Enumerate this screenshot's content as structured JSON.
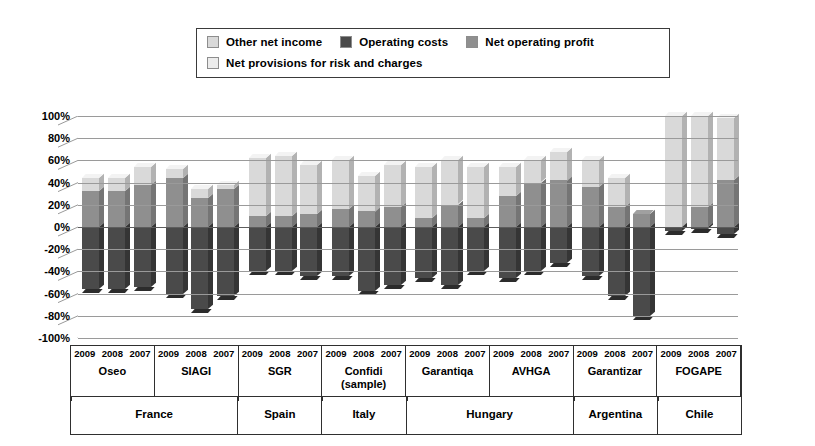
{
  "legend": {
    "rows": [
      [
        {
          "label": "Other net income",
          "color": "#d9d9d9",
          "key": "other_net_income"
        },
        {
          "label": "Operating costs",
          "color": "#4a4a4a",
          "key": "operating_costs"
        },
        {
          "label": "Net operating profit",
          "color": "#8f8f8f",
          "key": "net_operating_profit"
        }
      ],
      [
        {
          "label": "Net provisions for risk and charges",
          "color": "#ececec",
          "key": "net_provisions"
        }
      ]
    ]
  },
  "chart_data": {
    "type": "bar",
    "stacked": true,
    "title": "",
    "xlabel": "",
    "ylabel": "",
    "ylim": [
      -100,
      100
    ],
    "ytick_labels": [
      "100%",
      "80%",
      "60%",
      "40%",
      "20%",
      "0%",
      "-20%",
      "-40%",
      "-60%",
      "-80%",
      "-100%"
    ],
    "ytick_values": [
      100,
      80,
      60,
      40,
      20,
      0,
      -20,
      -40,
      -60,
      -80,
      -100
    ],
    "grid": true,
    "legend_position": "top",
    "series": [
      {
        "name": "Other net income",
        "color": "#d9d9d9"
      },
      {
        "name": "Operating costs",
        "color": "#4a4a4a"
      },
      {
        "name": "Net operating profit",
        "color": "#8f8f8f"
      },
      {
        "name": "Net provisions for risk and charges",
        "color": "#ececec"
      }
    ],
    "groups": [
      {
        "institution": "Oseo",
        "country": "France",
        "bars": [
          {
            "year": "2009",
            "net_operating_profit": 32,
            "other_net_income": 12,
            "net_provisions": 0,
            "operating_costs": -56
          },
          {
            "year": "2008",
            "net_operating_profit": 32,
            "other_net_income": 12,
            "net_provisions": 0,
            "operating_costs": -56
          },
          {
            "year": "2007",
            "net_operating_profit": 38,
            "other_net_income": 16,
            "net_provisions": 0,
            "operating_costs": -54
          }
        ]
      },
      {
        "institution": "SIAGI",
        "country": "France",
        "bars": [
          {
            "year": "2009",
            "net_operating_profit": 44,
            "other_net_income": 8,
            "net_provisions": 0,
            "operating_costs": -60
          },
          {
            "year": "2008",
            "net_operating_profit": 26,
            "other_net_income": 8,
            "net_provisions": 0,
            "operating_costs": -74
          },
          {
            "year": "2007",
            "net_operating_profit": 34,
            "other_net_income": 4,
            "net_provisions": 0,
            "operating_costs": -62
          }
        ]
      },
      {
        "institution": "SGR",
        "country": "Spain",
        "bars": [
          {
            "year": "2009",
            "net_operating_profit": 10,
            "other_net_income": 52,
            "net_provisions": 0,
            "operating_costs": -40
          },
          {
            "year": "2008",
            "net_operating_profit": 10,
            "other_net_income": 54,
            "net_provisions": 0,
            "operating_costs": -40
          },
          {
            "year": "2007",
            "net_operating_profit": 12,
            "other_net_income": 44,
            "net_provisions": 0,
            "operating_costs": -44
          }
        ]
      },
      {
        "institution": "Confidi (sample)",
        "country": "Italy",
        "bars": [
          {
            "year": "2009",
            "net_operating_profit": 16,
            "other_net_income": 44,
            "net_provisions": 0,
            "operating_costs": -44
          },
          {
            "year": "2008",
            "net_operating_profit": 14,
            "other_net_income": 32,
            "net_provisions": 0,
            "operating_costs": -58
          },
          {
            "year": "2007",
            "net_operating_profit": 18,
            "other_net_income": 38,
            "net_provisions": 0,
            "operating_costs": -52
          }
        ]
      },
      {
        "institution": "Garantiqa",
        "country": "Hungary",
        "bars": [
          {
            "year": "2009",
            "net_operating_profit": 8,
            "other_net_income": 46,
            "net_provisions": 0,
            "operating_costs": -46
          },
          {
            "year": "2008",
            "net_operating_profit": 20,
            "other_net_income": 40,
            "net_provisions": 0,
            "operating_costs": -52
          },
          {
            "year": "2007",
            "net_operating_profit": 8,
            "other_net_income": 46,
            "net_provisions": 0,
            "operating_costs": -40
          }
        ]
      },
      {
        "institution": "AVHGA",
        "country": "Hungary",
        "bars": [
          {
            "year": "2009",
            "net_operating_profit": 28,
            "other_net_income": 26,
            "net_provisions": 0,
            "operating_costs": -46
          },
          {
            "year": "2008",
            "net_operating_profit": 40,
            "other_net_income": 20,
            "net_provisions": 0,
            "operating_costs": -40
          },
          {
            "year": "2007",
            "net_operating_profit": 42,
            "other_net_income": 26,
            "net_provisions": 0,
            "operating_costs": -32
          }
        ]
      },
      {
        "institution": "Garantizar",
        "country": "Argentina",
        "bars": [
          {
            "year": "2009",
            "net_operating_profit": 36,
            "other_net_income": 24,
            "net_provisions": 0,
            "operating_costs": -44
          },
          {
            "year": "2008",
            "net_operating_profit": 18,
            "other_net_income": 26,
            "net_provisions": 0,
            "operating_costs": -62
          },
          {
            "year": "2007",
            "net_operating_profit": 12,
            "other_net_income": 0,
            "net_provisions": 0,
            "operating_costs": -80
          }
        ]
      },
      {
        "institution": "FOGAPE",
        "country": "Chile",
        "bars": [
          {
            "year": "2009",
            "net_operating_profit": 0,
            "other_net_income": 100,
            "net_provisions": 0,
            "operating_costs": -4
          },
          {
            "year": "2008",
            "net_operating_profit": 18,
            "other_net_income": 82,
            "net_provisions": 0,
            "operating_costs": -2
          },
          {
            "year": "2007",
            "net_operating_profit": 42,
            "other_net_income": 56,
            "net_provisions": 0,
            "operating_costs": -6
          }
        ]
      }
    ]
  }
}
